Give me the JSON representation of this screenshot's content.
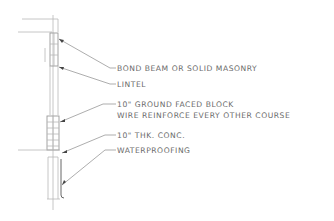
{
  "drawing": {
    "title": "Wall Section Detail",
    "annotations": [
      {
        "id": "bond-beam",
        "text": "BOND BEAM OR SOLID MASONRY"
      },
      {
        "id": "lintel",
        "text": "LINTEL"
      },
      {
        "id": "block",
        "text": "10\" GROUND FACED BLOCK"
      },
      {
        "id": "wire",
        "text": "WIRE REINFORCE EVERY OTHER COURSE"
      },
      {
        "id": "conc",
        "text": "10\" THK. CONC."
      },
      {
        "id": "waterproofing",
        "text": "WATERPROOFING"
      }
    ]
  }
}
